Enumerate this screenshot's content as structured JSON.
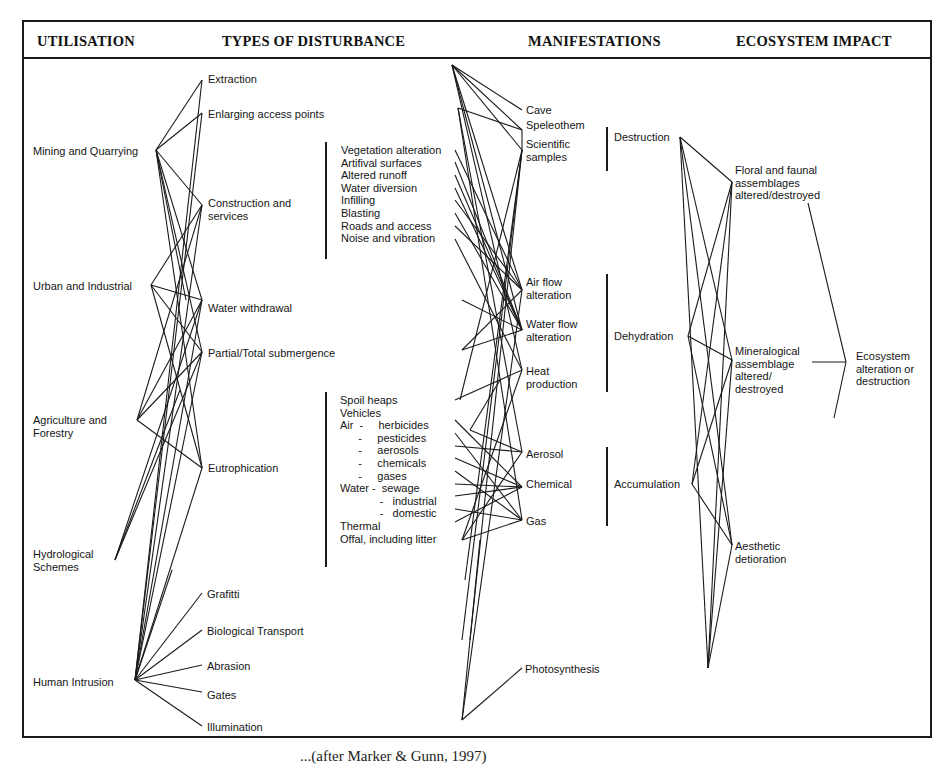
{
  "headers": {
    "utilisation": "UTILISATION",
    "disturbance": "TYPES OF DISTURBANCE",
    "manifestations": "MANIFESTATIONS",
    "impact": "ECOSYSTEM IMPACT"
  },
  "utilisation": [
    "Mining and Quarrying",
    "Urban and Industrial",
    "Agriculture and\nForestry",
    "Hydrological\nSchemes",
    "Human Intrusion"
  ],
  "disturbance": [
    "Extraction",
    "Enlarging access points",
    "Construction and\nservices",
    "Water withdrawal",
    "Partial/Total submergence",
    "Eutrophication",
    "Grafitti",
    "Biological Transport",
    "Abrasion",
    "Gates",
    "Illumination"
  ],
  "construction_subitems": [
    "Vegetation alteration",
    "Artifival surfaces",
    "Altered runoff",
    "Water diversion",
    "Infilling",
    "Blasting",
    "Roads and access",
    "Noise and vibration"
  ],
  "eutrophication_subitems": [
    "Spoil heaps",
    "Vehicles",
    "Air  -     herbicides",
    "      -     pesticides",
    "      -     aerosols",
    "      -     chemicals",
    "      -     gases",
    "Water -  sewage",
    "             -   industrial",
    "             -   domestic",
    "Thermal",
    "Offal, including litter"
  ],
  "manifestations": [
    "Cave",
    "Speleothem",
    "Scientific\nsamples",
    "Air flow\nalteration",
    "Water flow\nalteration",
    "Heat\nproduction",
    "Aerosol",
    "Chemical",
    "Gas",
    "Photosynthesis"
  ],
  "manifestation_groups": [
    "Destruction",
    "Dehydration",
    "Accumulation"
  ],
  "impacts": [
    "Floral and faunal\nassemblages\naltered/destroyed",
    "Mineralogical\nassemblage\naltered/\ndestroyed",
    "Aesthetic\ndetioration"
  ],
  "final_impact": "Ecosystem\nalteration or\ndestruction",
  "caption": "...(after Marker & Gunn, 1997)"
}
